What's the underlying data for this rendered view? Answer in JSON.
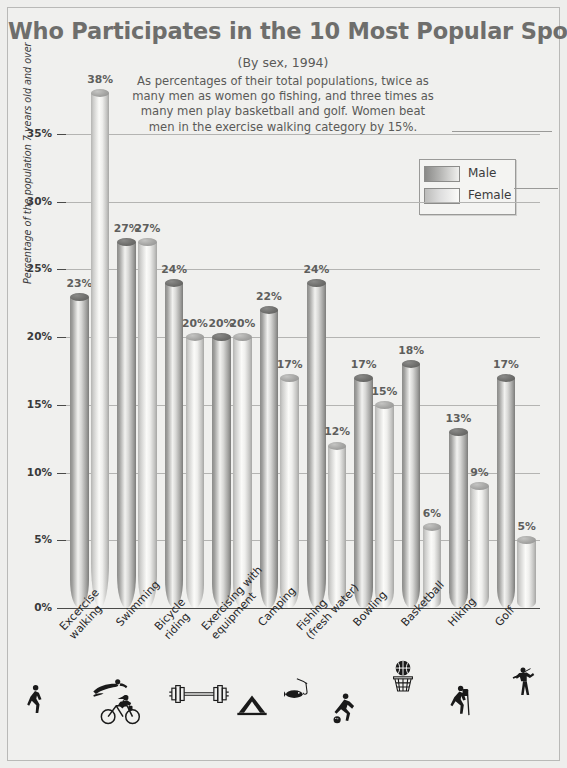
{
  "title": "Who Participates in the 10 Most Popular Sports?",
  "subtitle": "(By sex, 1994)",
  "blurb": "As percentages of their total populations, twice as many men as women go fishing, and three times as many men play basketball and golf.  Women beat men in the exercise walking category by 15%.",
  "legend": {
    "male_label": "Male",
    "female_label": "Female"
  },
  "chart_data": {
    "type": "bar",
    "title": "Who Participates in the 10 Most Popular Sports?",
    "subtitle": "(By sex, 1994)",
    "xlabel": "",
    "ylabel": "Percentage of the population 7 years old and over",
    "ylim": [
      0,
      38
    ],
    "ytick_labels": [
      "0%",
      "5%",
      "10%",
      "15%",
      "20%",
      "25%",
      "30%",
      "35%"
    ],
    "ytick_values": [
      0,
      5,
      10,
      15,
      20,
      25,
      30,
      35
    ],
    "grid": true,
    "legend_position": "top-right",
    "categories": [
      "Excercise\nwalking",
      "Swimming",
      "Bicycle\nriding",
      "Exercising with\nequipment",
      "Camping",
      "Fishing\n(fresh water)",
      "Bowling",
      "Basketball",
      "Hiking",
      "Golf"
    ],
    "category_icons": [
      "walking-icon",
      "swimming-icon",
      "bicycle-icon",
      "barbell-icon",
      "tent-icon",
      "fishing-icon",
      "bowling-icon",
      "basketball-icon",
      "hiking-icon",
      "golf-icon"
    ],
    "series": [
      {
        "name": "Male",
        "values": [
          23,
          27,
          24,
          20,
          22,
          24,
          17,
          18,
          13,
          17
        ],
        "labels": [
          "23%",
          "27%",
          "24%",
          "20%",
          "22%",
          "24%",
          "17%",
          "18%",
          "13%",
          "17%"
        ]
      },
      {
        "name": "Female",
        "values": [
          38,
          27,
          20,
          20,
          17,
          12,
          15,
          6,
          9,
          5
        ],
        "labels": [
          "38%",
          "27%",
          "20%",
          "20%",
          "17%",
          "12%",
          "15%",
          "6%",
          "9%",
          "5%"
        ]
      }
    ]
  }
}
